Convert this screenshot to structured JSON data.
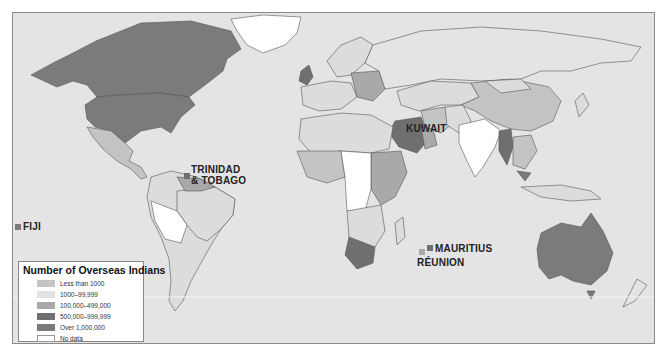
{
  "map": {
    "title": "Number of Overseas Indians",
    "colors": {
      "ocean": "#e4e4e4",
      "less_than_1000": "#c4c4c4",
      "r1000_99999": "#dcdcdc",
      "r100000_499000": "#a9a9a9",
      "r500000_999999": "#6f6f6f",
      "over_1000000": "#7b7b7b",
      "no_data": "#ffffff",
      "border": "#555555"
    },
    "labels": {
      "trinidad_line1": "TRINIDAD",
      "trinidad_line2": "& TOBAGO",
      "kuwait": "KUWAIT",
      "fiji": "FIJI",
      "mauritius": "MAURITIUS",
      "reunion": "RÉUNION"
    }
  },
  "legend": {
    "title": "Number of Overseas Indians",
    "items": [
      {
        "label": "Less than 1000",
        "color": "#c4c4c4"
      },
      {
        "label": "1000–99,999",
        "color": "#e2e2e2"
      },
      {
        "label": "100,000–499,000",
        "color": "#a9a9a9"
      },
      {
        "label": "500,000–999,999",
        "color": "#6f6f6f"
      },
      {
        "label": "Over 1,000,000",
        "color": "#7b7b7b"
      },
      {
        "label": "No data",
        "color": "#ffffff"
      }
    ]
  }
}
